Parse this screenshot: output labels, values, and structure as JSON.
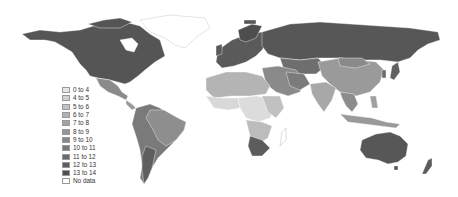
{
  "map": {
    "type": "choropleth",
    "region": "world",
    "colors": {
      "background": "#ffffff",
      "no_data": "#ffffff",
      "border": "#ffffff"
    }
  },
  "legend": {
    "items": [
      {
        "label": "0 to 4",
        "color": "#e6e6e6"
      },
      {
        "label": "4 to 5",
        "color": "#d2d2d2"
      },
      {
        "label": "5 to 6",
        "color": "#c2c2c2"
      },
      {
        "label": "6 to 7",
        "color": "#b2b2b2"
      },
      {
        "label": "7 to 8",
        "color": "#a3a3a3"
      },
      {
        "label": "8 to 9",
        "color": "#959595"
      },
      {
        "label": "9 to 10",
        "color": "#878787"
      },
      {
        "label": "10 to 11",
        "color": "#797979"
      },
      {
        "label": "11 to 12",
        "color": "#6b6b6b"
      },
      {
        "label": "12 to 13",
        "color": "#5d5d5d"
      },
      {
        "label": "13 to 14",
        "color": "#4f4f4f"
      },
      {
        "label": "No data",
        "color": "#ffffff"
      }
    ]
  }
}
